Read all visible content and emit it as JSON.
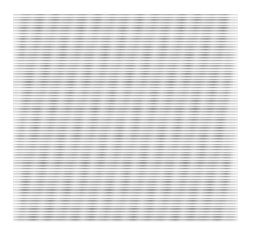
{
  "image": {
    "description": "Grayscale texture of fine horizontal striped lines with subtle wavy distortions",
    "colors": {
      "line": "#8a8a8a",
      "background": "#ffffff",
      "highlight": "#f2f2f2"
    },
    "region": {
      "x": 13,
      "y": 14,
      "width": 225,
      "height": 208
    },
    "line_period_px": 2.7
  }
}
